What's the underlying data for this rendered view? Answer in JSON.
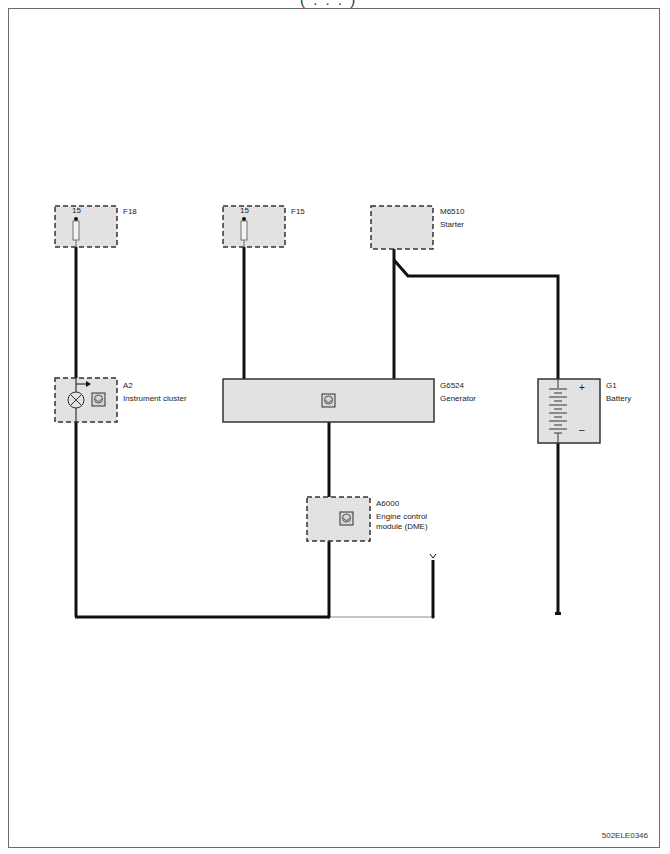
{
  "document": {
    "title_fragment": "( . . . )",
    "drawing_code": "502ELE0346"
  },
  "components": [
    {
      "id": "F18",
      "name": "",
      "pin": "15",
      "type": "fuse"
    },
    {
      "id": "F15",
      "name": "",
      "pin": "15",
      "type": "fuse"
    },
    {
      "id": "M6510",
      "name": "Starter",
      "type": "starter"
    },
    {
      "id": "A2",
      "name": "Instrument cluster",
      "type": "control-unit-with-lamp"
    },
    {
      "id": "G6524",
      "name": "Generator",
      "type": "generator"
    },
    {
      "id": "G1",
      "name": "Battery",
      "type": "battery",
      "plus": "+",
      "minus": "–"
    },
    {
      "id": "A6000",
      "name_line1": "Engine control",
      "name_line2": "module (DME)",
      "type": "control-unit"
    }
  ],
  "colors": {
    "wire": "#111111",
    "thin_wire": "#8a8a8a",
    "component_fill": "#e2e2e2",
    "dashed_border": "#333333",
    "frame": "#6a6a6a"
  }
}
